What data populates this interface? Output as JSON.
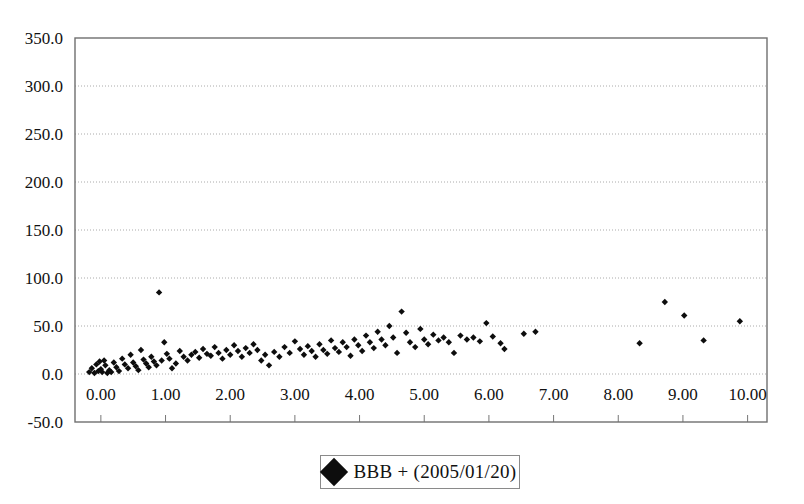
{
  "chart_data": {
    "type": "scatter",
    "title": "",
    "xlabel": "",
    "ylabel": "",
    "xlim": [
      -0.4,
      10.3
    ],
    "ylim": [
      -50.0,
      350.0
    ],
    "grid": true,
    "legend_position": "bottom-center",
    "y_ticks": [
      "350.0",
      "300.0",
      "250.0",
      "200.0",
      "150.0",
      "100.0",
      "50.0",
      "0.0",
      "-50.0"
    ],
    "y_tick_values": [
      350.0,
      300.0,
      250.0,
      200.0,
      150.0,
      100.0,
      50.0,
      0.0,
      -50.0
    ],
    "x_ticks": [
      "0.00",
      "1.00",
      "2.00",
      "3.00",
      "4.00",
      "5.00",
      "6.00",
      "7.00",
      "8.00",
      "9.00",
      "10.00"
    ],
    "x_tick_values": [
      0,
      1,
      2,
      3,
      4,
      5,
      6,
      7,
      8,
      9,
      10
    ],
    "series": [
      {
        "name": "BBB + (2005/01/20)",
        "marker": "diamond",
        "color": "#0d0d0d",
        "points": [
          [
            -0.18,
            2
          ],
          [
            -0.14,
            6
          ],
          [
            -0.1,
            1
          ],
          [
            -0.07,
            10
          ],
          [
            -0.04,
            3
          ],
          [
            -0.02,
            13
          ],
          [
            0.0,
            5
          ],
          [
            0.02,
            2
          ],
          [
            0.05,
            14
          ],
          [
            0.07,
            9
          ],
          [
            0.1,
            1
          ],
          [
            0.13,
            4
          ],
          [
            0.16,
            2
          ],
          [
            0.2,
            12
          ],
          [
            0.24,
            7
          ],
          [
            0.28,
            3
          ],
          [
            0.33,
            16
          ],
          [
            0.37,
            10
          ],
          [
            0.42,
            6
          ],
          [
            0.46,
            20
          ],
          [
            0.5,
            12
          ],
          [
            0.54,
            8
          ],
          [
            0.58,
            4
          ],
          [
            0.62,
            25
          ],
          [
            0.66,
            15
          ],
          [
            0.7,
            11
          ],
          [
            0.74,
            7
          ],
          [
            0.78,
            18
          ],
          [
            0.82,
            13
          ],
          [
            0.86,
            9
          ],
          [
            0.9,
            85
          ],
          [
            0.94,
            14
          ],
          [
            0.98,
            33
          ],
          [
            1.02,
            21
          ],
          [
            1.06,
            16
          ],
          [
            1.1,
            6
          ],
          [
            1.16,
            11
          ],
          [
            1.22,
            24
          ],
          [
            1.28,
            18
          ],
          [
            1.34,
            14
          ],
          [
            1.4,
            20
          ],
          [
            1.46,
            23
          ],
          [
            1.52,
            17
          ],
          [
            1.58,
            26
          ],
          [
            1.64,
            21
          ],
          [
            1.7,
            19
          ],
          [
            1.76,
            28
          ],
          [
            1.82,
            22
          ],
          [
            1.88,
            16
          ],
          [
            1.94,
            25
          ],
          [
            2.0,
            20
          ],
          [
            2.06,
            30
          ],
          [
            2.12,
            24
          ],
          [
            2.18,
            18
          ],
          [
            2.24,
            27
          ],
          [
            2.3,
            22
          ],
          [
            2.36,
            31
          ],
          [
            2.42,
            25
          ],
          [
            2.48,
            14
          ],
          [
            2.54,
            20
          ],
          [
            2.6,
            9
          ],
          [
            2.68,
            23
          ],
          [
            2.76,
            18
          ],
          [
            2.84,
            28
          ],
          [
            2.92,
            22
          ],
          [
            3.0,
            34
          ],
          [
            3.08,
            26
          ],
          [
            3.14,
            20
          ],
          [
            3.2,
            29
          ],
          [
            3.26,
            24
          ],
          [
            3.32,
            18
          ],
          [
            3.38,
            31
          ],
          [
            3.44,
            25
          ],
          [
            3.5,
            21
          ],
          [
            3.56,
            35
          ],
          [
            3.62,
            27
          ],
          [
            3.68,
            23
          ],
          [
            3.74,
            33
          ],
          [
            3.8,
            28
          ],
          [
            3.86,
            19
          ],
          [
            3.92,
            36
          ],
          [
            3.98,
            30
          ],
          [
            4.04,
            24
          ],
          [
            4.1,
            40
          ],
          [
            4.16,
            33
          ],
          [
            4.22,
            27
          ],
          [
            4.28,
            44
          ],
          [
            4.34,
            36
          ],
          [
            4.4,
            30
          ],
          [
            4.46,
            50
          ],
          [
            4.52,
            38
          ],
          [
            4.58,
            22
          ],
          [
            4.65,
            65
          ],
          [
            4.72,
            43
          ],
          [
            4.78,
            33
          ],
          [
            4.86,
            28
          ],
          [
            4.94,
            47
          ],
          [
            5.0,
            36
          ],
          [
            5.06,
            31
          ],
          [
            5.14,
            41
          ],
          [
            5.22,
            35
          ],
          [
            5.3,
            38
          ],
          [
            5.38,
            33
          ],
          [
            5.46,
            22
          ],
          [
            5.56,
            40
          ],
          [
            5.66,
            36
          ],
          [
            5.76,
            38
          ],
          [
            5.86,
            34
          ],
          [
            5.96,
            53
          ],
          [
            6.06,
            39
          ],
          [
            6.18,
            32
          ],
          [
            6.24,
            26
          ],
          [
            6.54,
            42
          ],
          [
            6.72,
            44
          ],
          [
            8.33,
            32
          ],
          [
            8.72,
            75
          ],
          [
            9.02,
            61
          ],
          [
            9.32,
            35
          ],
          [
            9.88,
            55
          ]
        ]
      }
    ]
  },
  "legend": {
    "label": "BBB + (2005/01/20)",
    "marker_name": "diamond-marker"
  }
}
